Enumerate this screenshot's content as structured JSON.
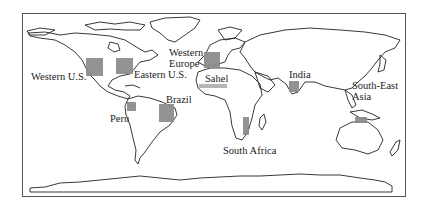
{
  "map": {
    "title": "",
    "colors": {
      "region_fill": "#8a8a8a",
      "sahel_fill": "#b0b0b0",
      "coastline": "#222222",
      "frame": "#555555",
      "background": "#ffffff"
    },
    "regions": [
      {
        "id": "western-us",
        "label": "Western U.S.",
        "box": {
          "x": 86,
          "y": 58,
          "w": 17,
          "h": 18
        },
        "label_pos": {
          "x": 31,
          "y": 71
        }
      },
      {
        "id": "eastern-us",
        "label": "Eastern U.S.",
        "box": {
          "x": 116,
          "y": 58,
          "w": 17,
          "h": 16
        },
        "label_pos": {
          "x": 134,
          "y": 69
        }
      },
      {
        "id": "western-europe",
        "label": "Western\nEurope",
        "label_lines": [
          "Western",
          "Europe"
        ],
        "box": {
          "x": 204,
          "y": 52,
          "w": 16,
          "h": 16
        },
        "label_pos": {
          "x": 169,
          "y": 47
        }
      },
      {
        "id": "sahel",
        "label": "Sahel",
        "box": {
          "x": 199,
          "y": 84,
          "w": 28,
          "h": 4
        },
        "label_pos": {
          "x": 205,
          "y": 74
        }
      },
      {
        "id": "brazil",
        "label": "Brazil",
        "box": {
          "x": 159,
          "y": 104,
          "w": 15,
          "h": 18
        },
        "label_pos": {
          "x": 166,
          "y": 94
        }
      },
      {
        "id": "peru",
        "label": "Peru",
        "box": {
          "x": 127,
          "y": 102,
          "w": 9,
          "h": 9
        },
        "label_pos": {
          "x": 110,
          "y": 113
        }
      },
      {
        "id": "india",
        "label": "India",
        "box": {
          "x": 289,
          "y": 81,
          "w": 10,
          "h": 11
        },
        "label_pos": {
          "x": 289,
          "y": 70
        }
      },
      {
        "id": "south-east-asia",
        "label": "South-East\nAsia",
        "label_lines": [
          "South-East",
          "Asia"
        ],
        "box": {
          "x": 355,
          "y": 117,
          "w": 12,
          "h": 6
        },
        "label_pos": {
          "x": 352,
          "y": 80
        }
      },
      {
        "id": "south-africa",
        "label": "South Africa",
        "box": {
          "x": 243,
          "y": 117,
          "w": 6,
          "h": 18
        },
        "label_pos": {
          "x": 223,
          "y": 145
        }
      }
    ]
  }
}
